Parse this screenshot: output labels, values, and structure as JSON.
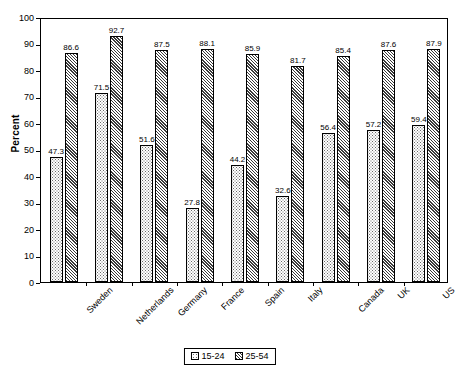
{
  "chart_data": {
    "type": "bar",
    "title": "",
    "xlabel": "",
    "ylabel": "Percent",
    "ylim": [
      0,
      100
    ],
    "ytick_step": 10,
    "yticks": [
      100,
      90,
      80,
      70,
      60,
      50,
      40,
      30,
      20,
      10,
      0
    ],
    "grid": false,
    "legend_position": "bottom-center",
    "categories": [
      "Sweden",
      "Netherlands",
      "Germany",
      "France",
      "Spain",
      "Italy",
      "Canada",
      "UK",
      "US"
    ],
    "series": [
      {
        "name": "15-24",
        "pattern": "fine-dots",
        "values": [
          47.3,
          71.5,
          51.6,
          27.8,
          44.2,
          32.6,
          56.4,
          57.2,
          59.4
        ]
      },
      {
        "name": "25-54",
        "pattern": "diagonal-hatch",
        "values": [
          86.6,
          92.7,
          87.5,
          88.1,
          85.9,
          81.7,
          85.4,
          87.6,
          87.9
        ]
      }
    ]
  },
  "colors": {
    "axis": "#000000",
    "background": "#ffffff",
    "series_young_ink": "#6b6b6b",
    "series_prime_ink": "#3a3a3a"
  }
}
